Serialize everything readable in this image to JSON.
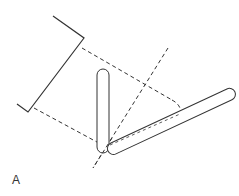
{
  "figure": {
    "panel_label": "A",
    "colors": {
      "stroke": "#333333",
      "rod_fill": "#ffffff",
      "background": "#ffffff"
    },
    "elements": [
      {
        "name": "projection-plane",
        "type": "polyline",
        "style": "solid"
      },
      {
        "name": "vertical-rod",
        "type": "rounded-rod",
        "style": "solid"
      },
      {
        "name": "tilted-rod",
        "type": "rounded-rod",
        "style": "solid"
      },
      {
        "name": "diagonal-axis",
        "type": "line",
        "style": "dashed"
      },
      {
        "name": "projection-line-upper",
        "type": "line",
        "style": "dashed"
      },
      {
        "name": "projection-line-lower",
        "type": "line",
        "style": "dashed"
      },
      {
        "name": "rod-shadow-outline",
        "type": "path",
        "style": "dashed"
      }
    ]
  }
}
